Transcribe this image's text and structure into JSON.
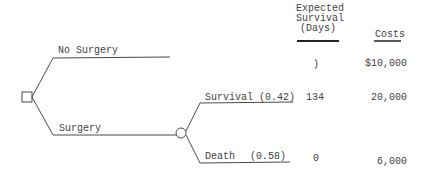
{
  "columns": {
    "survival_header": [
      "Expected",
      "Survival",
      "(Days)"
    ],
    "costs_header": "Costs"
  },
  "decision_node": {
    "shape": "square"
  },
  "branches": {
    "no_surgery": {
      "label": "No Surgery",
      "survival": ")",
      "cost": "$10,000"
    },
    "surgery": {
      "label": "Surgery",
      "chance_node": {
        "shape": "circle"
      },
      "outcomes": [
        {
          "label": "Survival",
          "probability": "(0.42)",
          "survival": "134",
          "cost": "20,000"
        },
        {
          "label": "Death",
          "probability": "(0.58)",
          "survival": "0",
          "cost": "6,000"
        }
      ]
    }
  },
  "colors": {
    "line": "#4a4a4a",
    "text": "#3f3f3f"
  }
}
